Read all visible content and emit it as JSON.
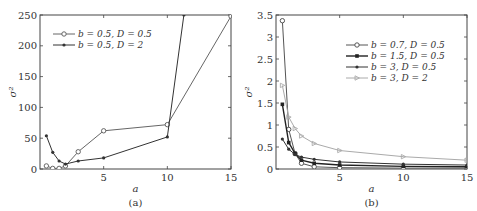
{
  "chart_data": [
    {
      "type": "line",
      "panel": "(a)",
      "xlabel": "a",
      "ylabel": "σ²",
      "xlim": [
        0,
        15
      ],
      "ylim": [
        0,
        250
      ],
      "xticks": [
        5,
        10,
        15
      ],
      "yticks": [
        0,
        50,
        100,
        150,
        200,
        250
      ],
      "grid": false,
      "legend_position": "upper left",
      "series": [
        {
          "name": "b=0.5, D=0.5",
          "marker": "circle",
          "color": "#666666",
          "x": [
            0.5,
            1,
            1.5,
            2,
            3,
            5,
            10,
            15
          ],
          "y": [
            5,
            1,
            1,
            5,
            28,
            62,
            72,
            248
          ]
        },
        {
          "name": "b=0.5, D=2",
          "marker": "dot",
          "color": "#333333",
          "x": [
            0.5,
            1,
            1.5,
            2,
            3,
            5,
            10,
            11.3
          ],
          "y": [
            54,
            27,
            13,
            8,
            13,
            18,
            52,
            250
          ]
        }
      ]
    },
    {
      "type": "line",
      "panel": "(b)",
      "xlabel": "a",
      "ylabel": "σ²",
      "xlim": [
        0,
        15
      ],
      "ylim": [
        0,
        3.5
      ],
      "xticks": [
        5,
        10,
        15
      ],
      "yticks": [
        0,
        0.5,
        1,
        1.5,
        2,
        2.5,
        3,
        3.5
      ],
      "grid": false,
      "legend_position": "upper right",
      "series": [
        {
          "name": "b=0.7, D=0.5",
          "marker": "circle",
          "color": "#555555",
          "x": [
            0.5,
            1,
            1.5,
            2,
            3,
            5,
            10,
            15
          ],
          "y": [
            3.37,
            0.9,
            0.35,
            0.13,
            0.05,
            0.03,
            0.02,
            0.02
          ]
        },
        {
          "name": "b=1.5, D=0.5",
          "marker": "star",
          "color": "#222222",
          "x": [
            0.5,
            1,
            1.5,
            2,
            3,
            5,
            10,
            15
          ],
          "y": [
            1.47,
            0.6,
            0.35,
            0.2,
            0.13,
            0.09,
            0.06,
            0.05
          ]
        },
        {
          "name": "b=3, D=0.5",
          "marker": "dot",
          "color": "#333333",
          "x": [
            0.5,
            1,
            1.5,
            2,
            3,
            5,
            10,
            15
          ],
          "y": [
            0.68,
            0.45,
            0.33,
            0.27,
            0.22,
            0.16,
            0.11,
            0.09
          ]
        },
        {
          "name": "b=3, D=2",
          "marker": "triangle-right",
          "color": "#aaaaaa",
          "x": [
            0.5,
            1,
            1.5,
            2,
            3,
            5,
            10,
            15
          ],
          "y": [
            1.9,
            1.18,
            0.92,
            0.75,
            0.58,
            0.42,
            0.28,
            0.2
          ]
        }
      ]
    }
  ],
  "panels": [
    {
      "caption": "(a)",
      "xlabel": "a",
      "ylabel": "σ²",
      "xtick_labels": [
        "5",
        "10",
        "15"
      ],
      "ytick_labels": [
        "0",
        "50",
        "100",
        "150",
        "200",
        "250"
      ],
      "legend": [
        "b = 0.5, D = 0.5",
        "b = 0.5, D = 2"
      ]
    },
    {
      "caption": "(b)",
      "xlabel": "a",
      "ylabel": "σ²",
      "xtick_labels": [
        "5",
        "10",
        "15"
      ],
      "ytick_labels": [
        "0",
        "0.5",
        "1",
        "1.5",
        "2",
        "2.5",
        "3",
        "3.5"
      ],
      "legend": [
        "b = 0.7, D = 0.5",
        "b = 1.5, D = 0.5",
        "b = 3, D = 0.5",
        "b = 3, D = 2"
      ]
    }
  ]
}
